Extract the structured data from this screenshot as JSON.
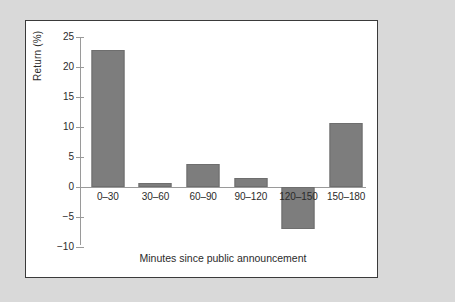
{
  "figure": {
    "background_color": "#d9d9d9",
    "panel_color": "#ffffff",
    "border_color": "#3a3a3a",
    "bar_color": "#7d7d7d",
    "axis_color": "#9a9a9a"
  },
  "chart_data": {
    "type": "bar",
    "title": "",
    "subtitle": "",
    "xlabel": "Minutes since public announcement",
    "ylabel": "Return (%)",
    "categories": [
      "0–30",
      "30–60",
      "60–90",
      "90–120",
      "120–150",
      "150–180"
    ],
    "values": [
      22.8,
      0.7,
      3.8,
      1.5,
      -7.0,
      10.6
    ],
    "ylim": [
      -10,
      25
    ],
    "yticks": [
      25,
      20,
      15,
      10,
      5,
      0,
      -5,
      -10
    ],
    "ytick_labels": [
      "25",
      "20",
      "15",
      "10",
      "5",
      "0",
      "−5",
      "−10"
    ],
    "grid": false,
    "legend": null,
    "legend_position": "none",
    "annotations": []
  }
}
